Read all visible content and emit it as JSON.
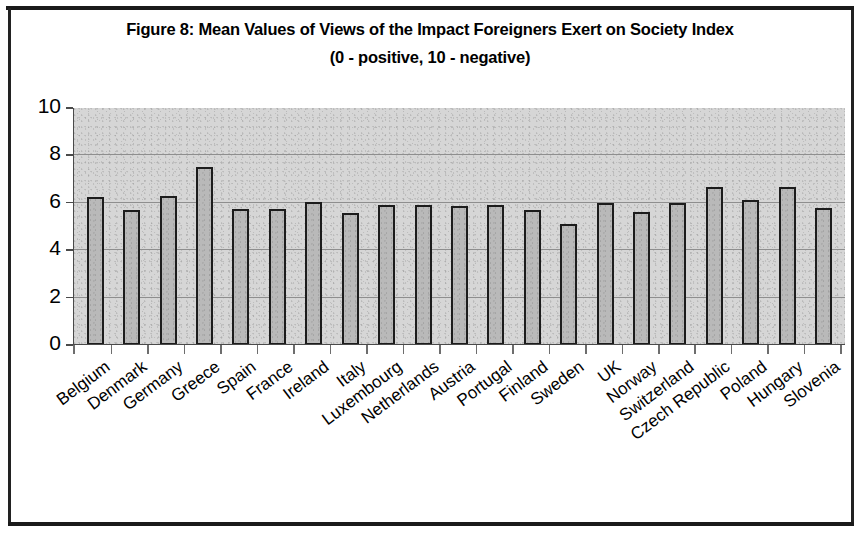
{
  "figure": {
    "title": "Figure 8: Mean Values of Views of the Impact Foreigners Exert on Society Index",
    "subtitle": "(0 - positive, 10 - negative)"
  },
  "chart_data": {
    "type": "bar",
    "title": "Figure 8: Mean Values of Views of the Impact Foreigners Exert on Society Index (0 - positive, 10 - negative)",
    "xlabel": "",
    "ylabel": "",
    "ylim": [
      0,
      10
    ],
    "yticks": [
      0,
      2,
      4,
      6,
      8,
      10
    ],
    "grid": true,
    "legend": "none",
    "categories": [
      "Belgium",
      "Denmark",
      "Germany",
      "Greece",
      "Spain",
      "France",
      "Ireland",
      "Italy",
      "Luxembourg",
      "Netherlands",
      "Austria",
      "Portugal",
      "Finland",
      "Sweden",
      "UK",
      "Norway",
      "Switzerland",
      "Czech Republic",
      "Poland",
      "Hungary",
      "Slovenia"
    ],
    "values": [
      6.25,
      5.7,
      6.3,
      7.5,
      5.75,
      5.75,
      6.05,
      5.55,
      5.9,
      5.9,
      5.85,
      5.9,
      5.7,
      5.1,
      6.0,
      5.6,
      6.0,
      6.65,
      6.1,
      6.65,
      5.8
    ],
    "colors": {
      "bar_fill": "#b9b9b9",
      "bar_border": "#1c1c1c",
      "plot_background": "#d6d6d6",
      "gridline": "#8e8e8e",
      "axis": "#4a4a4a",
      "text": "#000000",
      "page_background": "#ffffff"
    }
  }
}
